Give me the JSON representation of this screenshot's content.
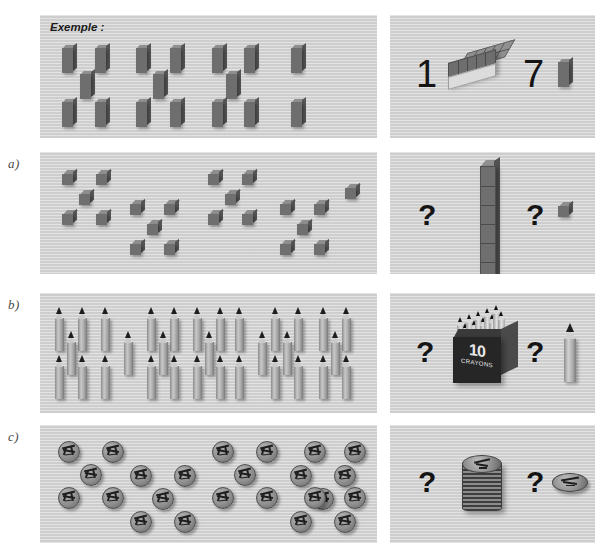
{
  "figure": {
    "caption": "Exemple :",
    "background_color": "#d4d4d4",
    "page_background": "#ffffff"
  },
  "rows": [
    {
      "id": "example",
      "label": "",
      "left_panel": {
        "caption": "Exemple :",
        "object": "brick",
        "object_label": "small upright block",
        "groups_of_five": 0,
        "total_count": 17,
        "layout": "three staggered rows of blocks"
      },
      "right_panel": {
        "answer_tens": "1",
        "tens_object": "bar-of-ten-cubes",
        "answer_units": "7",
        "units_object": "single-cube"
      }
    },
    {
      "id": "a",
      "label": "a)",
      "left_panel": {
        "caption": "",
        "object": "cube",
        "object_label": "wooden cube",
        "groups_of_five": 4,
        "extras": 1,
        "total_count": 21,
        "layout": "four quincunx groups of five plus one single cube"
      },
      "right_panel": {
        "answer_tens": "?",
        "tens_object": "tower-of-ten-cubes",
        "answer_units": "?",
        "units_object": "single-cube"
      }
    },
    {
      "id": "b",
      "label": "b)",
      "left_panel": {
        "caption": "",
        "object": "pencil",
        "object_label": "pencil",
        "groups_of_five": 5,
        "extras": 2,
        "total_count": 27,
        "layout": "five quincunx groups of five pencils plus extras"
      },
      "right_panel": {
        "answer_tens": "?",
        "tens_object": "box-of-ten-crayons",
        "box_number": "10",
        "box_word": "CRAYONS",
        "answer_units": "?",
        "units_object": "single-pencil"
      }
    },
    {
      "id": "c",
      "label": "c)",
      "left_panel": {
        "caption": "",
        "object": "coin",
        "object_label": "coin",
        "groups_of_five": 4,
        "extras": 4,
        "total_count": 24,
        "layout": "four quincunx groups of five coins plus four loose coins"
      },
      "right_panel": {
        "answer_tens": "?",
        "tens_object": "stack-of-ten-coins",
        "answer_units": "?",
        "units_object": "single-coin"
      }
    }
  ],
  "glyphs": {
    "question": "?",
    "one": "1",
    "seven": "7"
  }
}
